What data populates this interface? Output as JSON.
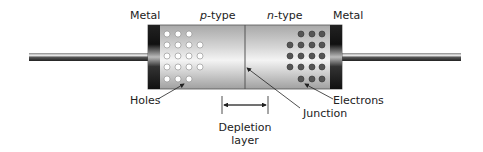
{
  "diagram": {
    "labels": {
      "metal_left": "Metal",
      "p_type_italic": "p",
      "p_type_suffix": "-type",
      "n_type_italic": "n",
      "n_type_suffix": "-type",
      "metal_right": "Metal",
      "holes": "Holes",
      "electrons": "Electrons",
      "junction": "Junction",
      "depletion_line1": "Depletion",
      "depletion_line2": "layer"
    },
    "carriers": {
      "holes": {
        "rows": [
          3,
          4,
          4,
          4,
          3
        ],
        "style": "open-circle",
        "color": "#ffffff"
      },
      "electrons": {
        "rows": [
          3,
          4,
          4,
          4,
          3
        ],
        "style": "filled-circle",
        "color": "#555555"
      }
    },
    "colors": {
      "body_light": "#f2f2f2",
      "body_mid": "#c8c8c8",
      "body_dark": "#9a9a9a",
      "metal_dark": "#1a1a1a",
      "wire_dark": "#333333",
      "text": "#222222"
    }
  }
}
